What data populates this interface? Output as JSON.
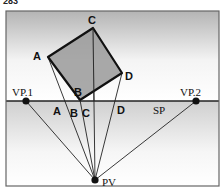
{
  "figure": {
    "number": "283",
    "colors": {
      "frame": "#555555",
      "sky_top": "#b4b4b4",
      "ground_top": "#cfcfcf",
      "square_fill": "#9a9a9a",
      "line": "#222222"
    }
  },
  "square": {
    "vertices": {
      "A": {
        "label": "A",
        "x": 48,
        "y": 57
      },
      "C": {
        "label": "C",
        "x": 93,
        "y": 28
      },
      "D": {
        "label": "D",
        "x": 122,
        "y": 73
      },
      "B": {
        "label": "B",
        "x": 80,
        "y": 100
      }
    }
  },
  "horizon": {
    "y": 101,
    "x1": 6,
    "x2": 219
  },
  "points": {
    "vp1": {
      "label": "VP.1",
      "x": 26,
      "y": 101
    },
    "vp2": {
      "label": "VP.2",
      "x": 196,
      "y": 101
    },
    "pv": {
      "label": "PV",
      "x": 95,
      "y": 180
    }
  },
  "picture_plane": {
    "label": "SP",
    "intersections": [
      {
        "label": "A",
        "x": 57
      },
      {
        "label": "B",
        "x": 73
      },
      {
        "label": "C",
        "x": 86
      },
      {
        "label": "D",
        "x": 122
      }
    ]
  }
}
